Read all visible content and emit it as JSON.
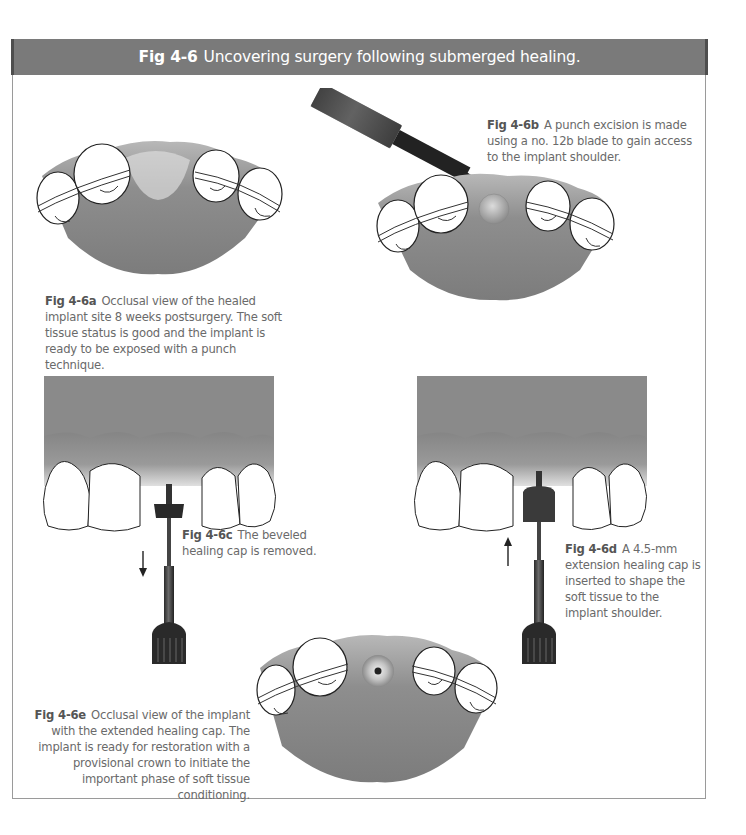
{
  "figure": {
    "label": "Fig 4-6",
    "title": "Uncovering surgery following submerged healing.",
    "header_color": "#7a7a7a",
    "border_color": "#9a9a9a"
  },
  "panels": [
    {
      "id": "a",
      "label": "Fig 4-6a",
      "caption": "Occlusal view of the healed implant site 8 weeks postsurgery. The soft tissue status is good and the implant is ready to be exposed with a punch technique.",
      "illustration": "occlusal-view-healed-site"
    },
    {
      "id": "b",
      "label": "Fig 4-6b",
      "caption": "A punch excision is made using a no. 12b blade to gain access to the implant shoulder.",
      "illustration": "punch-excision-with-blade"
    },
    {
      "id": "c",
      "label": "Fig 4-6c",
      "caption": "The beveled healing cap is removed.",
      "illustration": "healing-cap-removal",
      "arrow": "down"
    },
    {
      "id": "d",
      "label": "Fig 4-6d",
      "caption": "A 4.5-mm extension healing cap is inserted to shape the soft tissue to the implant shoulder.",
      "illustration": "extension-cap-insertion",
      "arrow": "up"
    },
    {
      "id": "e",
      "label": "Fig 4-6e",
      "caption": "Occlusal view of the implant with the extended healing cap. The implant is ready for restoration with a provisional crown to initiate the important phase of soft tissue conditioning.",
      "illustration": "occlusal-view-extended-cap"
    }
  ]
}
